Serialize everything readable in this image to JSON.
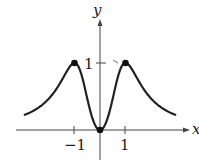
{
  "chart_data": {
    "type": "line",
    "title": "",
    "xlabel": "x",
    "ylabel": "y",
    "x_ticks": [
      {
        "value": -1,
        "label": "−1"
      },
      {
        "value": 1,
        "label": "1"
      }
    ],
    "y_ticks": [
      {
        "value": 1,
        "label": "1"
      }
    ],
    "xlim": [
      -3,
      3
    ],
    "ylim": [
      0,
      1
    ],
    "grid": false,
    "function_description": "y = 2x^2/(1+x^4)",
    "series": [
      {
        "name": "curve",
        "x": [
          -3,
          -2.5,
          -2,
          -1.5,
          -1,
          -0.75,
          -0.5,
          -0.25,
          0,
          0.25,
          0.5,
          0.75,
          1,
          1.5,
          2,
          2.5,
          3
        ],
        "y": [
          0.22,
          0.31,
          0.47,
          0.74,
          1.0,
          0.86,
          0.47,
          0.12,
          0,
          0.12,
          0.47,
          0.86,
          1.0,
          0.74,
          0.47,
          0.31,
          0.22
        ]
      }
    ],
    "marked_points": [
      {
        "x": -1,
        "y": 1
      },
      {
        "x": 0,
        "y": 0
      },
      {
        "x": 1,
        "y": 1
      }
    ]
  },
  "labels": {
    "x_axis": "x",
    "y_axis": "y",
    "x_tick_neg1": "−1",
    "x_tick_1": "1",
    "y_tick_1": "1"
  }
}
